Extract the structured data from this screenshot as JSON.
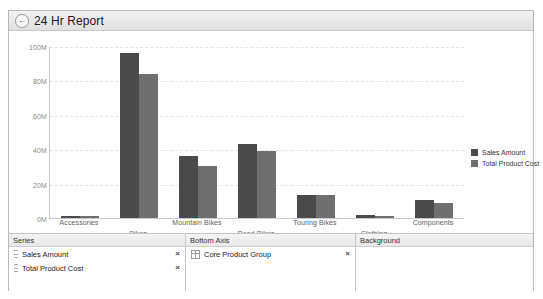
{
  "window": {
    "title": "24 Hr Report",
    "back_icon": "back-arrow-icon",
    "back_glyph": "←"
  },
  "chart_data": {
    "type": "bar",
    "title": "",
    "xlabel": "",
    "ylabel": "",
    "ylim": [
      0,
      100
    ],
    "y_unit": "M",
    "ytick_labels": [
      "0M",
      "20M",
      "40M",
      "60M",
      "80M",
      "100M"
    ],
    "ytick_values": [
      0,
      20,
      40,
      60,
      80,
      100
    ],
    "grid": true,
    "legend_position": "right",
    "categories": [
      "Accessories",
      "Bikes",
      "Mountain Bikes",
      "Road Bikes",
      "Touring Bikes",
      "Clothing",
      "Components"
    ],
    "series": [
      {
        "name": "Sales Amount",
        "color": "#4a4a4a",
        "values": [
          1.1,
          96,
          36,
          43,
          13.5,
          1.6,
          10.2
        ]
      },
      {
        "name": "Total Product Cost",
        "color": "#6f6f6f",
        "values": [
          0.9,
          84,
          30.5,
          39,
          13.2,
          1.4,
          9.0
        ]
      }
    ]
  },
  "panes": {
    "series": {
      "header": "Series",
      "items": [
        {
          "label": "Sales Amount",
          "remove": "×"
        },
        {
          "label": "Total Product Cost",
          "remove": "×"
        }
      ]
    },
    "bottom_axis": {
      "header": "Bottom Axis",
      "items": [
        {
          "label": "Core Product Group",
          "remove": "×"
        }
      ]
    },
    "background": {
      "header": "Background",
      "items": []
    }
  }
}
